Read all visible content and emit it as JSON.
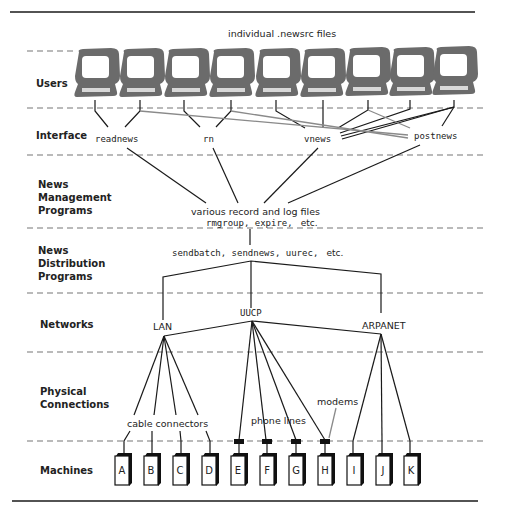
{
  "figure": {
    "top_annotation": "individual .newsrc files",
    "layers": [
      {
        "id": "users",
        "label_lines": [
          "Users"
        ]
      },
      {
        "id": "interface",
        "label_lines": [
          "Interface"
        ]
      },
      {
        "id": "news-management",
        "label_lines": [
          "News",
          "Management",
          "Programs"
        ]
      },
      {
        "id": "news-distribution",
        "label_lines": [
          "News",
          "Distribution",
          "Programs"
        ]
      },
      {
        "id": "networks",
        "label_lines": [
          "Networks"
        ]
      },
      {
        "id": "physical",
        "label_lines": [
          "Physical",
          "Connections"
        ]
      },
      {
        "id": "machines",
        "label_lines": [
          "Machines"
        ]
      }
    ],
    "user_terminal_count": 9,
    "interface_programs": [
      "readnews",
      "rn",
      "vnews",
      "postnews"
    ],
    "management": {
      "line1": "various record and log files",
      "line2_mono": "rmgroup, expire,",
      "line2_tail": "etc."
    },
    "distribution": {
      "mono": "sendbatch, sendnews, uurec,",
      "tail": "etc."
    },
    "networks": [
      "LAN",
      "UUCP",
      "ARPANET"
    ],
    "physical_labels": {
      "cable": "cable connectors",
      "phone": "phone lines",
      "modems": "modems"
    },
    "machines": [
      "A",
      "B",
      "C",
      "D",
      "E",
      "F",
      "G",
      "H",
      "I",
      "J",
      "K"
    ],
    "colors": {
      "monitor": "#6b6b6b",
      "line": "#1a1a1a",
      "gray_line": "#8a8a8a",
      "dash": "#777777"
    }
  }
}
